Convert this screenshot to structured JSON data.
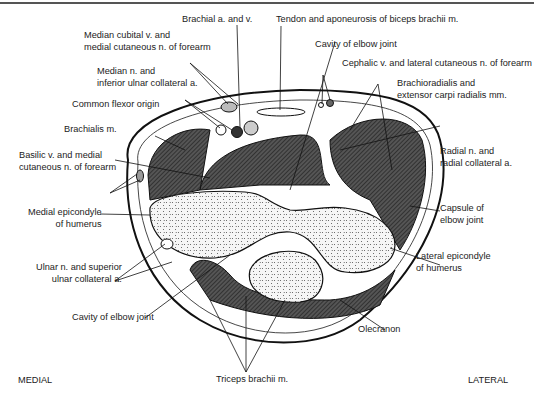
{
  "figure": {
    "orientation": {
      "left": "MEDIAL",
      "right": "LATERAL"
    },
    "labels": {
      "brachial": [
        "Brachial a. and v."
      ],
      "tendon_biceps": [
        "Tendon and aponeurosis of biceps brachii m."
      ],
      "median_cubital": [
        "Median cubital v. and",
        "medial cutaneous n. of forearm"
      ],
      "cavity_top": [
        "Cavity of elbow joint"
      ],
      "cephalic": [
        "Cephalic v. and lateral cutaneous n. of forearm"
      ],
      "median_n": [
        "Median n. and",
        "inferior ulnar collateral a."
      ],
      "brachioradialis": [
        "Brachioradialis and",
        "extensor carpi radialis mm."
      ],
      "common_flexor": [
        "Common flexor origin"
      ],
      "brachialis": [
        "Brachialis m."
      ],
      "radial_n": [
        "Radial n. and",
        "radial collateral a."
      ],
      "basilic": [
        "Basilic v. and medial",
        "cutaneous n. of forearm"
      ],
      "capsule": [
        "Capsule of",
        "elbow joint"
      ],
      "medial_epicondyle": [
        "Medial epicondyle",
        "of humerus"
      ],
      "lateral_epicondyle": [
        "Lateral epicondyle",
        "of humerus"
      ],
      "ulnar_n": [
        "Ulnar n. and superior",
        "ulnar collateral a."
      ],
      "cavity_bottom": [
        "Cavity of elbow joint"
      ],
      "olecranon": [
        "Olecranon"
      ],
      "triceps": [
        "Triceps brachii m."
      ]
    },
    "colors": {
      "muscle": "#4a4a4a",
      "bone": "#f4f4f4",
      "line": "#1a1a1a",
      "background": "#ffffff"
    }
  }
}
